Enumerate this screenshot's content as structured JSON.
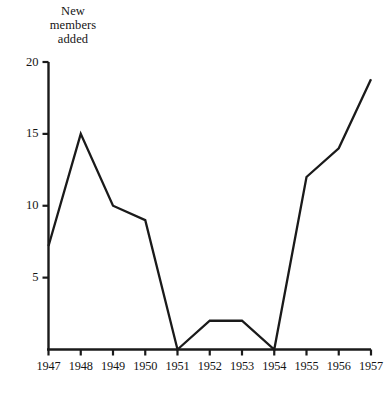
{
  "chart_data": {
    "type": "line",
    "title": "",
    "ylabel": "New\nmembers\nadded",
    "xlabel": "",
    "categories": [
      "1947",
      "1948",
      "1949",
      "1950",
      "1951",
      "1952",
      "1953",
      "1954",
      "1955",
      "1956",
      "1957"
    ],
    "x": [
      1947,
      1948,
      1949,
      1950,
      1951,
      1952,
      1953,
      1954,
      1955,
      1956,
      1957
    ],
    "values": [
      7.2,
      15,
      10,
      9,
      0,
      2,
      2,
      0,
      12,
      14,
      18.8
    ],
    "series": [
      {
        "name": "New members added",
        "values": [
          7.2,
          15,
          10,
          9,
          0,
          2,
          2,
          0,
          12,
          14,
          18.8
        ]
      }
    ],
    "ylim": [
      0,
      20
    ],
    "yticks": [
      5,
      10,
      15,
      20
    ],
    "ytick_labels": [
      "5",
      "10",
      "15",
      "20"
    ],
    "xtick_labels": [
      "1947",
      "1948",
      "1949",
      "1950",
      "1951",
      "1952",
      "1953",
      "1954",
      "1955",
      "1956",
      "1957"
    ],
    "grid": false,
    "legend": false,
    "line_color": "#1a1a1a",
    "axis_color": "#1a1a1a",
    "background_color": "#ffffff"
  },
  "axis": {
    "y_title_line1": "New",
    "y_title_line2": "members",
    "y_title_line3": "added"
  }
}
